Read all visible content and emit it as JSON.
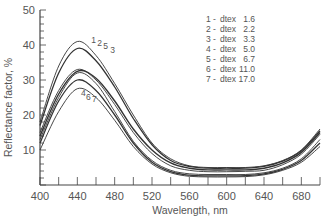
{
  "chart_data": {
    "type": "line",
    "title": "",
    "xlabel": "Wavelength, nm",
    "ylabel": "Reflectance factor, %",
    "xlim": [
      400,
      700
    ],
    "ylim": [
      0,
      50
    ],
    "x_ticks": [
      400,
      440,
      480,
      520,
      560,
      600,
      640,
      680
    ],
    "y_ticks": [
      10,
      20,
      30,
      40,
      50
    ],
    "grid": false,
    "legend_position": "top-right",
    "legend": [
      "1 - dtex  1.6",
      "2 - dtex  2.2",
      "3 - dtex  3.3",
      "4 - dtex  5.0",
      "5 - dtex  6.7",
      "6 - dtex 11.0",
      "7 - dtex 17.0"
    ],
    "annotations": [
      {
        "text": "1 2 5 3",
        "near_x": 455,
        "near_y": 39
      },
      {
        "text": "4 6 7",
        "near_x": 445,
        "near_y": 24
      }
    ],
    "x": [
      400,
      420,
      440,
      460,
      480,
      500,
      520,
      540,
      560,
      580,
      600,
      620,
      640,
      660,
      680,
      700
    ],
    "series": [
      {
        "name": "1 - dtex 1.6",
        "values": [
          18,
          34,
          41,
          37,
          29,
          20,
          12,
          7.5,
          5.5,
          5,
          5,
          5,
          5.5,
          7,
          10,
          16
        ]
      },
      {
        "name": "2 - dtex 2.2",
        "values": [
          17,
          32,
          39,
          35.5,
          28,
          19,
          11.5,
          7,
          5.3,
          4.8,
          4.8,
          4.8,
          5.3,
          6.8,
          9.8,
          15.5
        ]
      },
      {
        "name": "5 - dtex 6.7",
        "values": [
          15,
          27,
          33,
          30,
          23,
          15,
          9,
          5.5,
          4.2,
          3.8,
          3.8,
          3.9,
          4.2,
          5.8,
          8.8,
          14.5
        ]
      },
      {
        "name": "3 - dtex 3.3",
        "values": [
          14,
          26,
          32.5,
          30.5,
          24,
          16,
          10,
          6.3,
          4.8,
          4.3,
          4.3,
          4.3,
          4.8,
          6.3,
          9.3,
          15
        ]
      },
      {
        "name": "4 - dtex 5.0",
        "values": [
          13,
          25,
          32,
          29,
          21,
          12.5,
          7,
          4.2,
          3.2,
          3,
          3,
          3,
          3.5,
          4.8,
          7.5,
          13
        ]
      },
      {
        "name": "6 - dtex 11.0",
        "values": [
          12,
          24,
          30,
          27,
          20,
          12,
          6.5,
          3.8,
          2.8,
          2.6,
          2.6,
          2.7,
          3.2,
          4.5,
          7,
          12
        ]
      },
      {
        "name": "7 - dtex 17.0",
        "values": [
          10,
          21,
          27.5,
          25,
          18.5,
          11,
          6,
          3.5,
          2.5,
          2.3,
          2.3,
          2.4,
          2.9,
          4.2,
          6.5,
          11
        ]
      }
    ],
    "colors": {
      "lines": "#333333",
      "axis": "#444444",
      "text": "#555555",
      "background": "#ffffff"
    },
    "note": "Series values are approximate reconstructions from visual estimation; assignment of individual lines to dtex labels is uncertain."
  }
}
